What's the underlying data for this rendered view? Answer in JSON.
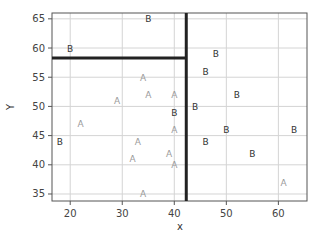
{
  "chart_data": {
    "type": "scatter",
    "title": "",
    "xlabel": "x",
    "ylabel": "Y",
    "xlim": [
      16.5,
      65.5
    ],
    "ylim": [
      33.8,
      66
    ],
    "xticks": [
      20,
      30,
      40,
      50,
      60
    ],
    "yticks": [
      35,
      40,
      45,
      50,
      55,
      60,
      65
    ],
    "grid": true,
    "legend": "none",
    "marker": "text-label",
    "series": [
      {
        "name": "A",
        "color": "#9a9a9a",
        "points": [
          [
            34,
            55
          ],
          [
            35,
            52
          ],
          [
            29,
            51
          ],
          [
            40,
            52
          ],
          [
            22,
            47
          ],
          [
            40,
            46
          ],
          [
            33,
            44
          ],
          [
            39,
            42
          ],
          [
            32,
            41
          ],
          [
            40,
            40
          ],
          [
            61,
            37
          ],
          [
            34,
            35
          ]
        ]
      },
      {
        "name": "B",
        "color": "#333333",
        "points": [
          [
            35,
            65
          ],
          [
            20,
            60
          ],
          [
            48,
            59
          ],
          [
            46,
            56
          ],
          [
            52,
            52
          ],
          [
            44,
            50
          ],
          [
            40,
            49
          ],
          [
            50,
            46
          ],
          [
            63,
            46
          ],
          [
            18,
            44
          ],
          [
            46,
            44
          ],
          [
            55,
            42
          ]
        ]
      }
    ],
    "annotations": [
      {
        "type": "vline",
        "x": 42.3,
        "y_from": 33.8,
        "y_to": 66,
        "color": "#222222",
        "width": 3
      },
      {
        "type": "hline",
        "y": 58.3,
        "x_from": 16.5,
        "x_to": 42.3,
        "color": "#222222",
        "width": 3
      }
    ]
  }
}
